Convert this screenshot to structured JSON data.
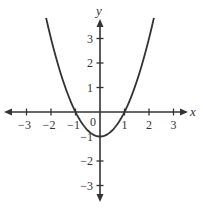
{
  "chart_data": {
    "type": "line",
    "title": "",
    "function": "y = x^2 - 1",
    "xlabel": "x",
    "ylabel": "y",
    "xlim": [
      -3.5,
      3.5
    ],
    "ylim": [
      -3.5,
      3.8
    ],
    "grid": false,
    "legend": null,
    "x_ticks": [
      -3,
      -2,
      -1,
      1,
      2,
      3
    ],
    "x_tick_labels": [
      "−3",
      "−2",
      "−1",
      "1",
      "2",
      "3"
    ],
    "y_ticks": [
      3,
      2,
      1,
      -1,
      -2,
      -3
    ],
    "y_tick_labels": [
      "3",
      "2",
      "1",
      "−1",
      "−2",
      "−3"
    ],
    "origin_label": "0",
    "series": [
      {
        "name": "parabola",
        "x": [
          -2.2,
          -2,
          -1.5,
          -1,
          -0.5,
          0,
          0.5,
          1,
          1.5,
          2,
          2.2
        ],
        "y": [
          3.84,
          3,
          1.25,
          0,
          -0.75,
          -1,
          -0.75,
          0,
          1.25,
          3,
          3.84
        ]
      }
    ],
    "x_axis_arrows": "both",
    "y_axis_arrows": "both"
  },
  "colors": {
    "axis": "#333333",
    "curve": "#333333",
    "background": "#ffffff"
  }
}
